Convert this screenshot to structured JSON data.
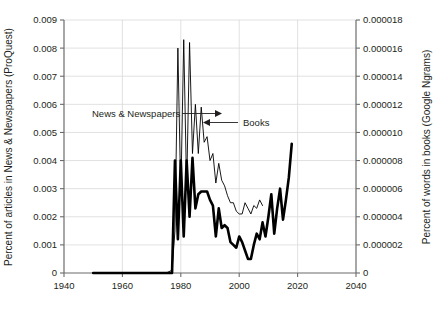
{
  "chart_data": {
    "type": "line",
    "title": "",
    "xlabel": "",
    "xlim": [
      1940,
      2040
    ],
    "xticks": [
      1940,
      1960,
      1980,
      2000,
      2020,
      2040
    ],
    "xtick_labels": [
      "1940",
      "1960",
      "1980",
      "2000",
      "2020",
      "2040"
    ],
    "grid": true,
    "legend_position": "inline-annotations",
    "axes": [
      {
        "id": "left",
        "ylabel": "Percent of articles in News & Newspapers (ProQuest)",
        "ylim": [
          0,
          0.009
        ],
        "yticks": [
          0,
          0.001,
          0.002,
          0.003,
          0.004,
          0.005,
          0.006,
          0.007,
          0.008,
          0.009
        ],
        "ytick_labels": [
          "0",
          "0.001",
          "0.002",
          "0.003",
          "0.004",
          "0.005",
          "0.006",
          "0.007",
          "0.008",
          "0.009"
        ]
      },
      {
        "id": "right",
        "ylabel": "Percent of words in books (Google Ngrams)",
        "ylim": [
          0,
          1.8e-05
        ],
        "yticks": [
          0,
          2e-06,
          4e-06,
          6e-06,
          8e-06,
          1e-05,
          1.2e-05,
          1.4e-05,
          1.6e-05,
          1.8e-05
        ],
        "ytick_labels": [
          "0",
          "0.000002",
          "0.000004",
          "0.000006",
          "0.000008",
          "0.000010",
          "0.000012",
          "0.000014",
          "0.000016",
          "0.000018"
        ]
      }
    ],
    "series": [
      {
        "name": "News & Newspapers",
        "axis": "left",
        "style": "thick",
        "annotation": "News & Newspapers",
        "x": [
          1950,
          1955,
          1960,
          1965,
          1970,
          1975,
          1977,
          1978,
          1979,
          1980,
          1981,
          1982,
          1983,
          1984,
          1985,
          1986,
          1987,
          1988,
          1989,
          1990,
          1991,
          1992,
          1993,
          1994,
          1995,
          1996,
          1997,
          1998,
          1999,
          2000,
          2001,
          2002,
          2003,
          2004,
          2005,
          2006,
          2007,
          2008,
          2009,
          2010,
          2011,
          2012,
          2013,
          2014,
          2015,
          2016,
          2017,
          2018
        ],
        "y": [
          0,
          0,
          0,
          0,
          0,
          0,
          0,
          0.004,
          0.0012,
          0.004,
          0.0013,
          0.004,
          0.002,
          0.0041,
          0.0023,
          0.0028,
          0.0029,
          0.0029,
          0.0029,
          0.0026,
          0.0024,
          0.0013,
          0.0023,
          0.0016,
          0.0017,
          0.0016,
          0.0011,
          0.001,
          0.0009,
          0.0013,
          0.0011,
          0.0008,
          0.0005,
          0.0005,
          0.001,
          0.0014,
          0.0012,
          0.0018,
          0.0013,
          0.002,
          0.0028,
          0.0014,
          0.0023,
          0.003,
          0.0019,
          0.0026,
          0.0034,
          0.0046
        ]
      },
      {
        "name": "Books",
        "axis": "right",
        "style": "thin",
        "annotation": "Books",
        "x": [
          1950,
          1955,
          1960,
          1965,
          1970,
          1975,
          1977,
          1978,
          1979,
          1980,
          1981,
          1982,
          1983,
          1984,
          1985,
          1986,
          1987,
          1988,
          1989,
          1990,
          1991,
          1992,
          1993,
          1994,
          1995,
          1996,
          1997,
          1998,
          1999,
          2000,
          2001,
          2002,
          2003,
          2004,
          2005,
          2006,
          2007,
          2008
        ],
        "y": [
          0,
          0,
          0,
          0,
          0,
          0,
          2e-07,
          3e-06,
          1.6e-05,
          5.5e-06,
          1.66e-05,
          6e-06,
          1.64e-05,
          8.5e-06,
          1.2e-05,
          8.5e-06,
          1.18e-05,
          9.3e-06,
          9.7e-06,
          8e-06,
          8.5e-06,
          6.4e-06,
          7.8e-06,
          6.6e-06,
          6.2e-06,
          5.5e-06,
          5e-06,
          5e-06,
          4.4e-06,
          4.2e-06,
          4.2e-06,
          5e-06,
          4.6e-06,
          4.2e-06,
          4.8e-06,
          4.6e-06,
          5.2e-06,
          4.8e-06
        ]
      }
    ],
    "annotations": [
      {
        "name": "news-annotation",
        "text": "News & Newspapers",
        "arrow": "right"
      },
      {
        "name": "books-annotation",
        "text": "Books",
        "arrow": "left"
      }
    ]
  }
}
